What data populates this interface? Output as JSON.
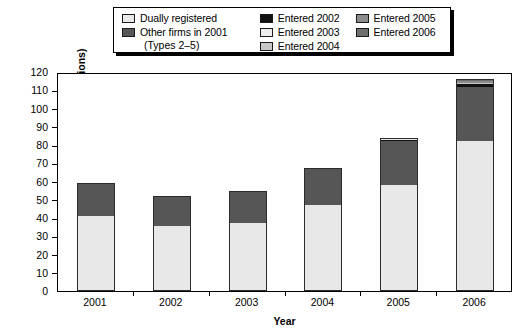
{
  "chart_data": {
    "type": "bar",
    "subtype": "stacked-bar",
    "title": "",
    "xlabel": "Year",
    "ylabel": "Total revenue ($ billions)",
    "categories": [
      "2001",
      "2002",
      "2003",
      "2004",
      "2005",
      "2006"
    ],
    "ylim": [
      0,
      120
    ],
    "yticks": [
      0,
      10,
      20,
      30,
      40,
      50,
      60,
      70,
      80,
      90,
      100,
      110,
      120
    ],
    "grid": false,
    "legend_position": "top-center",
    "series": [
      {
        "name": "Dually registered",
        "color": "#e8e8e8",
        "values": [
          41,
          35.5,
          37,
          47,
          58,
          82
        ]
      },
      {
        "name": "Other firms in 2001 (Types 2–5)",
        "color": "#565656",
        "values": [
          18,
          16.5,
          18,
          20,
          24,
          30
        ]
      },
      {
        "name": "Entered 2002",
        "color": "#111111",
        "values": [
          0,
          0,
          0,
          0.6,
          0.8,
          1.2
        ]
      },
      {
        "name": "Entered 2003",
        "color": "#ededed",
        "values": [
          0,
          0,
          0,
          0,
          0.3,
          0.5
        ]
      },
      {
        "name": "Entered 2004",
        "color": "#c8c8c8",
        "values": [
          0,
          0,
          0,
          0,
          0.3,
          0.5
        ]
      },
      {
        "name": "Entered 2005",
        "color": "#8c8c8c",
        "values": [
          0,
          0,
          0,
          0,
          0.6,
          0.8
        ]
      },
      {
        "name": "Entered 2006",
        "color": "#6e6e6e",
        "values": [
          0,
          0,
          0,
          0,
          0,
          1.0
        ]
      }
    ],
    "totals": [
      59,
      52,
      55,
      67.6,
      84,
      116
    ]
  },
  "legend": {
    "column1": [
      {
        "label": "Dually registered",
        "color": "#e8e8e8"
      },
      {
        "label": "Other firms in 2001",
        "color": "#565656"
      }
    ],
    "column1_note": "(Types 2–5)",
    "column2": [
      {
        "label": "Entered 2002",
        "color": "#111111"
      },
      {
        "label": "Entered 2003",
        "color": "#ededed"
      },
      {
        "label": "Entered 2004",
        "color": "#c8c8c8"
      }
    ],
    "column3": [
      {
        "label": "Entered 2005",
        "color": "#8c8c8c"
      },
      {
        "label": "Entered 2006",
        "color": "#6e6e6e"
      }
    ]
  },
  "axes": {
    "y_title": "Total revenue ($ billions)",
    "x_title": "Year",
    "y_labels": [
      "120",
      "110",
      "100",
      "90",
      "80",
      "70",
      "60",
      "50",
      "40",
      "30",
      "20",
      "10",
      "0"
    ],
    "x_labels": [
      "2001",
      "2002",
      "2003",
      "2004",
      "2005",
      "2006"
    ]
  }
}
